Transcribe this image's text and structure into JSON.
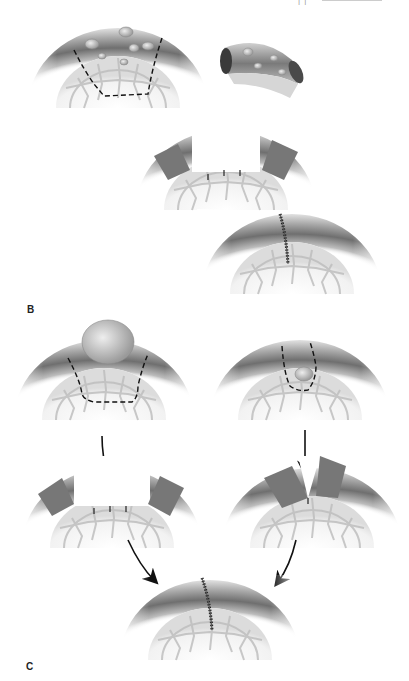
{
  "figure": {
    "header_fragment": "| |",
    "panels": [
      {
        "label": "B",
        "description": "Excision of a bowel segment with multiple lesions, followed by end-to-end reanastomosis",
        "steps": [
          {
            "name": "segment-with-lesions-marked",
            "marking": "dashed resection line"
          },
          {
            "name": "excised-segment",
            "note": "removed bowel segment with lesions"
          },
          {
            "name": "open-bowel-ends",
            "note": "cut ends after resection with stay sutures"
          },
          {
            "name": "sutured-anastomosis",
            "note": "end-to-end sutured anastomosis"
          }
        ]
      },
      {
        "label": "C",
        "description": "Two resection approaches (large bulging lesion vs. small lesion) converging to the same sutured result",
        "steps": [
          {
            "name": "large-lesion-wide-resection",
            "marking": "dashed wedge resection line"
          },
          {
            "name": "small-lesion-narrow-resection",
            "marking": "dashed narrow resection line"
          },
          {
            "name": "wide-defect",
            "note": "wide gap with stay sutures"
          },
          {
            "name": "narrow-defect",
            "note": "narrow V-shaped gap"
          },
          {
            "name": "sutured-closure",
            "note": "final sutured closure"
          }
        ]
      }
    ],
    "colors": {
      "background": "#ffffff",
      "tissue_dark": "#6e6e6e",
      "tissue_mid": "#a8a8a8",
      "tissue_light": "#dcdcdc",
      "mucosa": "#ececec",
      "line": "#111111"
    }
  }
}
